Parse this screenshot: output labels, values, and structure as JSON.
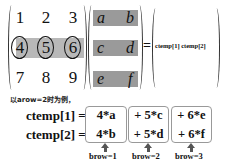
{
  "matrix_a": {
    "rows": [
      [
        "1",
        "2",
        "3"
      ],
      [
        "4",
        "5",
        "6"
      ],
      [
        "7",
        "8",
        "9"
      ]
    ],
    "highlighted_row": 2
  },
  "matrix_b": {
    "rows": [
      [
        "a",
        "b"
      ],
      [
        "c",
        "d"
      ],
      [
        "e",
        "f"
      ]
    ]
  },
  "equals": "=",
  "result": {
    "content": "ctemp[1] ctemp[2]"
  },
  "caption": "以arow=2时为例，",
  "equations": [
    {
      "lhs": "ctemp[1] =",
      "terms": [
        "4*a",
        "+ 5*c",
        "+ 6*e"
      ]
    },
    {
      "lhs": "ctemp[2] =",
      "terms": [
        "4*b",
        "+ 5*d",
        "+ 6*f"
      ]
    }
  ],
  "brow_labels": [
    "brow=1",
    "brow=2",
    "brow=3"
  ],
  "colors": {
    "row_highlight": "#b8b8b8",
    "cell_fill": "#9a9a9a",
    "box_border": "#999999"
  }
}
